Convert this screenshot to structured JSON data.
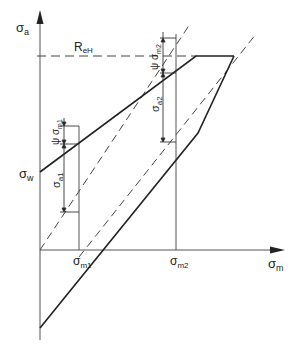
{
  "diagram": {
    "axes": {
      "y_label": "σ",
      "y_label_sub": "a",
      "x_label": "σ",
      "x_label_sub": "m"
    },
    "labels": {
      "reh": "R",
      "reh_sub": "eH",
      "sigma_w": "σ",
      "sigma_w_sub": "w",
      "sigma_m1": "σ",
      "sigma_m1_sub": "m1",
      "sigma_m2": "σ",
      "sigma_m2_sub": "m2",
      "sigma_a1": "σ",
      "sigma_a1_sub": "a1",
      "sigma_a2": "σ",
      "sigma_a2_sub": "a2",
      "psi_m1": "ψ σ",
      "psi_m1_sub": "m1",
      "psi_m2": "ψ σ",
      "psi_m2_sub": "m2"
    },
    "colors": {
      "line": "#222222",
      "thin": "#555555",
      "background": "#ffffff"
    }
  }
}
